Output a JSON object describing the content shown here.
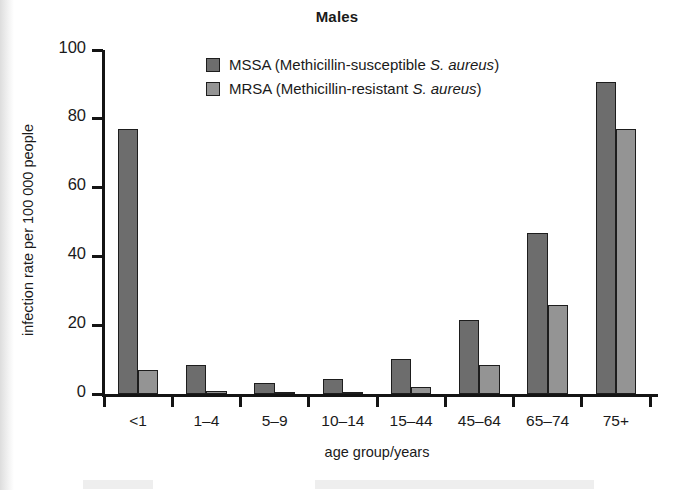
{
  "chart_data": {
    "type": "bar",
    "title": "Males",
    "xlabel": "age group/years",
    "ylabel": "infection rate per 100 000 people",
    "categories": [
      "<1",
      "1–4",
      "5–9",
      "10–14",
      "15–44",
      "45–64",
      "65–74",
      "75+"
    ],
    "series": [
      {
        "name": "MSSA",
        "color": "#6d6d6d",
        "values": [
          77,
          8.5,
          3.3,
          4.3,
          10.2,
          21.5,
          46.8,
          90.8
        ]
      },
      {
        "name": "MRSA",
        "color": "#949494",
        "values": [
          6.9,
          0.8,
          0.6,
          0.6,
          2.1,
          8.5,
          26.0,
          77.0
        ]
      }
    ],
    "ylim": [
      0,
      100
    ],
    "yticks": [
      0,
      20,
      40,
      60,
      80,
      100
    ],
    "ytick_labels": [
      "0",
      "20",
      "40",
      "60",
      "80",
      "100"
    ],
    "grid": false,
    "legend_position": "upper-center-inside"
  },
  "legend": {
    "entries": [
      {
        "swatch": "mssa",
        "prefix": "MSSA (Methicillin-susceptible ",
        "italic": "S. aureus",
        "suffix": ")"
      },
      {
        "swatch": "mrsa",
        "prefix": "MRSA (Methicillin-resistant ",
        "italic": "S. aureus",
        "suffix": ")"
      }
    ]
  }
}
